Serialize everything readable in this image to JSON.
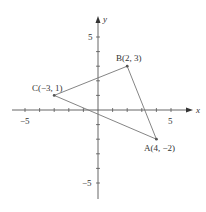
{
  "axes": {
    "x_label": "x",
    "y_label": "y",
    "x_tick_labels": [
      {
        "value": -5,
        "text": "−5"
      },
      {
        "value": 5,
        "text": "5"
      }
    ],
    "y_tick_labels": [
      {
        "value": 5,
        "text": "5"
      },
      {
        "value": -5,
        "text": "−5"
      }
    ],
    "x_range": [
      -6.5,
      6.5
    ],
    "y_range": [
      -6.5,
      6.5
    ]
  },
  "points": [
    {
      "name": "A",
      "label": "A(4, −2)",
      "x": 4,
      "y": -2
    },
    {
      "name": "B",
      "label": "B(2, 3)",
      "x": 2,
      "y": 3
    },
    {
      "name": "C",
      "label": "C(−3, 1)",
      "x": -3,
      "y": 1
    }
  ],
  "triangle": [
    "A",
    "B",
    "C"
  ],
  "colors": {
    "axis": "#555555",
    "line": "#777777",
    "point": "#555555",
    "text": "#333333"
  }
}
